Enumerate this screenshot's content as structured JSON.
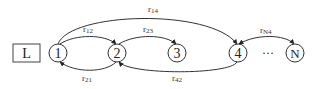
{
  "diagram": {
    "start_box": {
      "label": "L"
    },
    "nodes": [
      {
        "id": "1",
        "label": "1"
      },
      {
        "id": "2",
        "label": "2"
      },
      {
        "id": "3",
        "label": "3"
      },
      {
        "id": "4",
        "label": "4"
      },
      {
        "id": "N",
        "label": "N"
      }
    ],
    "ellipsis": "···",
    "edges": [
      {
        "from": "1",
        "to": "4",
        "label": "r14",
        "base": "r",
        "sub": "14"
      },
      {
        "from": "1",
        "to": "2",
        "label": "r12",
        "base": "r",
        "sub": "12"
      },
      {
        "from": "2",
        "to": "3",
        "label": "r23",
        "base": "r",
        "sub": "23"
      },
      {
        "from": "4",
        "to": "N",
        "label": "rN4",
        "base": "r",
        "sub": "N4"
      },
      {
        "from": "2",
        "to": "1",
        "label": "r21",
        "base": "r",
        "sub": "21"
      },
      {
        "from": "4",
        "to": "2",
        "label": "r42",
        "base": "r",
        "sub": "42"
      }
    ],
    "colors": {
      "stroke": "#333333",
      "background": "#ffffff"
    }
  }
}
